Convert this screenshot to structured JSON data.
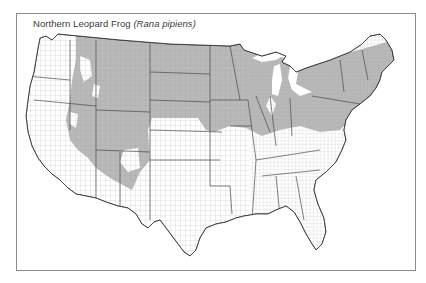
{
  "map": {
    "title": "Northern Leopard Frog",
    "scientific_name": "(Rana pipiens)",
    "region": "Contiguous United States",
    "unit": "counties",
    "legend": [],
    "colors": {
      "range_fill": "#b9b9b9",
      "non_range_fill": "#ffffff",
      "county_lines": "#8c8c8c",
      "state_lines": "#4a4a4a",
      "frame": "#8a8a8a",
      "title_text": "#3a3a3a"
    },
    "range_description": "Shaded counties cover the northern US from the Pacific Northwest interior and Great Basin east across the Rockies, Northern Plains, Great Lakes states, Ohio Valley and New England; southwest portions of Arizona/New Mexico partly shaded; South and Southeast unshaded."
  }
}
